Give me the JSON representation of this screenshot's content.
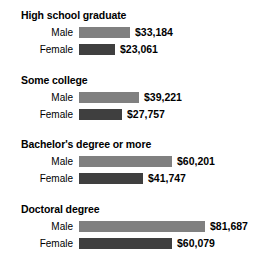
{
  "chart_data": {
    "type": "bar",
    "orientation": "horizontal",
    "title": "",
    "xlabel": "",
    "ylabel": "",
    "categories": [
      "High school graduate",
      "Some college",
      "Bachelor's degree or more",
      "Doctoral degree"
    ],
    "series": [
      {
        "name": "Male",
        "color": "#808080",
        "values": [
          33184,
          39221,
          60201,
          81687
        ],
        "labels": [
          "$33,184",
          "$39,221",
          "$60,201",
          "$81,687"
        ]
      },
      {
        "name": "Female",
        "color": "#3f3f3f",
        "values": [
          23061,
          27757,
          41747,
          60079
        ],
        "labels": [
          "$23,061",
          "$27,757",
          "$41,747",
          "$60,079"
        ]
      }
    ],
    "xlim": [
      0,
      81687
    ],
    "grid": false,
    "legend": "none"
  },
  "groups": [
    {
      "title": "High school graduate",
      "rows": [
        {
          "label": "Male",
          "value": 33184,
          "value_label": "$33,184",
          "series": "male"
        },
        {
          "label": "Female",
          "value": 23061,
          "value_label": "$23,061",
          "series": "female"
        }
      ]
    },
    {
      "title": "Some college",
      "rows": [
        {
          "label": "Male",
          "value": 39221,
          "value_label": "$39,221",
          "series": "male"
        },
        {
          "label": "Female",
          "value": 27757,
          "value_label": "$27,757",
          "series": "female"
        }
      ]
    },
    {
      "title": "Bachelor's degree or more",
      "rows": [
        {
          "label": "Male",
          "value": 60201,
          "value_label": "$60,201",
          "series": "male"
        },
        {
          "label": "Female",
          "value": 41747,
          "value_label": "$41,747",
          "series": "female"
        }
      ]
    },
    {
      "title": "Doctoral degree",
      "rows": [
        {
          "label": "Male",
          "value": 81687,
          "value_label": "$81,687",
          "series": "male"
        },
        {
          "label": "Female",
          "value": 60079,
          "value_label": "$60,079",
          "series": "female"
        }
      ]
    }
  ],
  "layout": {
    "bar_origin_x": 79,
    "max_bar_px": 126,
    "max_value": 81687,
    "group_top_start": 9,
    "group_spacing": 64.5,
    "row_offsets": [
      17,
      34
    ],
    "value_gap_px": 5
  }
}
